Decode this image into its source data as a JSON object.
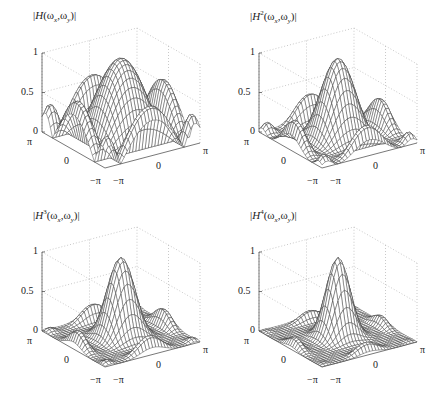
{
  "chart_data": [
    {
      "type": "surface",
      "title": "|H(ωx,ωy)|",
      "title_parts": {
        "pre": "|",
        "func": "H",
        "sup": "",
        "args": "(ω",
        "sx": "x",
        "mid": ",ω",
        "sy": "y",
        "post": ")|"
      },
      "power": 1,
      "function": "|H(ωx,ωy)|^n with H a separable 3-tap-like lowpass: H = ((1+cos ωx)/2 + sidelobes) product; peak 1 at origin",
      "zlim": [
        0,
        1
      ],
      "zticks": [
        "0",
        "0.5",
        "1"
      ],
      "x_ticks": [
        "−π",
        "0",
        "π"
      ],
      "y_ticks": [
        "π",
        "0",
        "−π"
      ],
      "peak": 1,
      "sidelobe_peak": 0.35
    },
    {
      "type": "surface",
      "title": "|H²(ωx,ωy)|",
      "title_parts": {
        "pre": "|",
        "func": "H",
        "sup": "2",
        "args": "(ω",
        "sx": "x",
        "mid": ",ω",
        "sy": "y",
        "post": ")|"
      },
      "power": 2,
      "zlim": [
        0,
        1
      ],
      "zticks": [
        "0",
        "0.5",
        "1"
      ],
      "x_ticks": [
        "−π",
        "0",
        "π"
      ],
      "y_ticks": [
        "π",
        "0",
        "−π"
      ],
      "peak": 1,
      "sidelobe_peak": 0.12
    },
    {
      "type": "surface",
      "title": "|H³(ωx,ωy)|",
      "title_parts": {
        "pre": "|",
        "func": "H",
        "sup": "3",
        "args": "(ω",
        "sx": "x",
        "mid": ",ω",
        "sy": "y",
        "post": ")|"
      },
      "power": 3,
      "zlim": [
        0,
        1
      ],
      "zticks": [
        "0",
        "0.5",
        "1"
      ],
      "x_ticks": [
        "−π",
        "0",
        "π"
      ],
      "y_ticks": [
        "π",
        "0",
        "−π"
      ],
      "peak": 1,
      "sidelobe_peak": 0.04
    },
    {
      "type": "surface",
      "title": "|H⁴(ωx,ωy)|",
      "title_parts": {
        "pre": "|",
        "func": "H",
        "sup": "4",
        "args": "(ω",
        "sx": "x",
        "mid": ",ω",
        "sy": "y",
        "post": ")|"
      },
      "power": 4,
      "zlim": [
        0,
        1
      ],
      "zticks": [
        "0",
        "0.5",
        "1"
      ],
      "x_ticks": [
        "−π",
        "0",
        "π"
      ],
      "y_ticks": [
        "π",
        "0",
        "−π"
      ],
      "peak": 1,
      "sidelobe_peak": 0.015
    }
  ],
  "style": {
    "mesh_line": "#3a3a3a",
    "mesh_fill": "#ffffff",
    "axis_line": "#555555",
    "grid_line": "#bbbbbb",
    "grid_count": 30
  }
}
